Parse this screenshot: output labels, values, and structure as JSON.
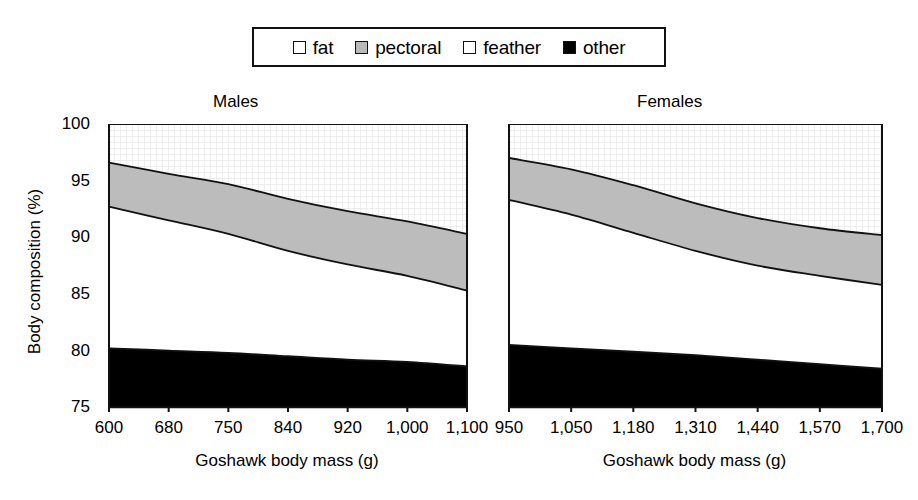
{
  "legend": {
    "items": [
      {
        "label": "fat",
        "swatch": "white-dotted",
        "color": "#ffffff"
      },
      {
        "label": "pectoral",
        "swatch": "gray",
        "color": "#b9b9b9"
      },
      {
        "label": "feather",
        "swatch": "white",
        "color": "#ffffff"
      },
      {
        "label": "other",
        "swatch": "black",
        "color": "#000000"
      }
    ]
  },
  "axes": {
    "ylabel": "Body composition (%)",
    "yticks": [
      "100",
      "95",
      "90",
      "85",
      "80",
      "75"
    ],
    "ylim": [
      75,
      100
    ],
    "xaxis_title": "Goshawk body mass (g)"
  },
  "panels": [
    {
      "title": "Males",
      "xticks": [
        "600",
        "680",
        "750",
        "840",
        "920",
        "1,000",
        "1,100"
      ]
    },
    {
      "title": "Females",
      "xticks": [
        "950",
        "1,050",
        "1,180",
        "1,310",
        "1,440",
        "1,570",
        "1,700"
      ]
    }
  ],
  "chart_data": {
    "type": "area",
    "title": "",
    "subtitle": "",
    "xlabel": "Goshawk body mass (g)",
    "ylabel": "Body composition (%)",
    "ylim": [
      75,
      100
    ],
    "grid": false,
    "legend_position": "top-center",
    "stacking": "cumulative-boundaries",
    "note": "Values are cumulative upper boundaries of each stacked band, read from the y-axis (percent of body composition). Bands bottom-to-top: other, feather, pectoral, fat.",
    "panels": [
      {
        "name": "Males",
        "x": [
          600,
          680,
          750,
          840,
          920,
          1000,
          1100
        ],
        "xticklabels": [
          "600",
          "680",
          "750",
          "840",
          "920",
          "1,000",
          "1,100"
        ],
        "boundaries": {
          "other_top": [
            80.2,
            80.0,
            79.8,
            79.5,
            79.2,
            79.0,
            78.6
          ],
          "feather_top": [
            92.7,
            91.5,
            90.3,
            88.8,
            87.6,
            86.6,
            85.3
          ],
          "pectoral_top": [
            96.6,
            95.6,
            94.7,
            93.4,
            92.3,
            91.4,
            90.3
          ],
          "fat_top": [
            100,
            100,
            100,
            100,
            100,
            100,
            100
          ]
        },
        "series": [
          {
            "name": "other",
            "values": [
              5.2,
              5.0,
              4.8,
              4.5,
              4.2,
              4.0,
              3.6
            ]
          },
          {
            "name": "feather",
            "values": [
              12.5,
              11.5,
              10.5,
              9.3,
              8.4,
              7.6,
              6.7
            ]
          },
          {
            "name": "pectoral",
            "values": [
              3.9,
              4.1,
              4.4,
              4.6,
              4.7,
              4.8,
              5.0
            ]
          },
          {
            "name": "fat",
            "values": [
              3.4,
              4.4,
              5.3,
              6.6,
              7.7,
              8.6,
              9.7
            ]
          }
        ]
      },
      {
        "name": "Females",
        "x": [
          950,
          1050,
          1180,
          1310,
          1440,
          1570,
          1700
        ],
        "xticklabels": [
          "950",
          "1,050",
          "1,180",
          "1,310",
          "1,440",
          "1,570",
          "1,700"
        ],
        "boundaries": {
          "other_top": [
            80.5,
            80.2,
            79.9,
            79.6,
            79.2,
            78.8,
            78.4
          ],
          "feather_top": [
            93.3,
            92.0,
            90.4,
            88.8,
            87.5,
            86.6,
            85.8
          ],
          "pectoral_top": [
            97.0,
            96.0,
            94.6,
            93.0,
            91.7,
            90.8,
            90.2
          ],
          "fat_top": [
            100,
            100,
            100,
            100,
            100,
            100,
            100
          ]
        },
        "series": [
          {
            "name": "other",
            "values": [
              5.5,
              5.2,
              4.9,
              4.6,
              4.2,
              3.8,
              3.4
            ]
          },
          {
            "name": "feather",
            "values": [
              12.8,
              11.8,
              10.5,
              9.2,
              8.3,
              7.8,
              7.4
            ]
          },
          {
            "name": "pectoral",
            "values": [
              3.7,
              4.0,
              4.2,
              4.2,
              4.2,
              4.2,
              4.4
            ]
          },
          {
            "name": "fat",
            "values": [
              3.0,
              4.0,
              5.4,
              7.0,
              8.3,
              9.2,
              9.8
            ]
          }
        ]
      }
    ]
  }
}
